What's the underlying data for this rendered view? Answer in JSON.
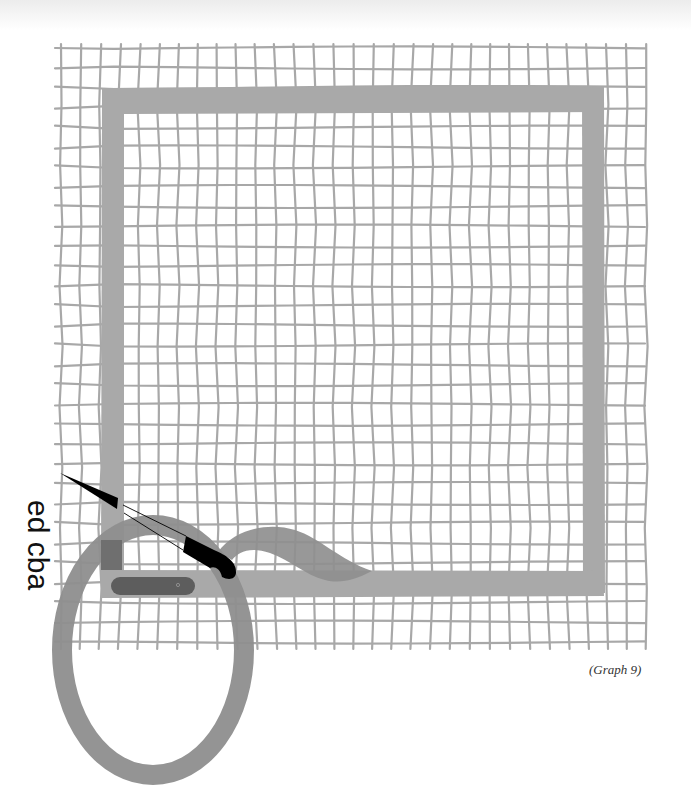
{
  "figure": {
    "caption": "(Graph 9)",
    "side_label": "ed cba",
    "colors": {
      "grid_line": "#a8a8a8",
      "frame": "#a9a9a9",
      "loop": "#8e8e8e",
      "overlap": "#6f6f6f",
      "knife": "#000000",
      "paper": "#ffffff"
    },
    "elements": [
      {
        "name": "hand-drawn grid",
        "desc": "approx 30x30 wobbly grid, ~20px spacing"
      },
      {
        "name": "square frame",
        "desc": "thick gray square outline over grid"
      },
      {
        "name": "loop",
        "desc": "large gray oval loop at bottom-left crossing the frame"
      },
      {
        "name": "wave",
        "desc": "gray wavy tail extending right from the loop"
      },
      {
        "name": "knife",
        "desc": "black knife with dashed-line blade gap, pointing up-left"
      },
      {
        "name": "dark bar",
        "desc": "dark rounded bar on the bottom edge of the frame"
      }
    ]
  }
}
